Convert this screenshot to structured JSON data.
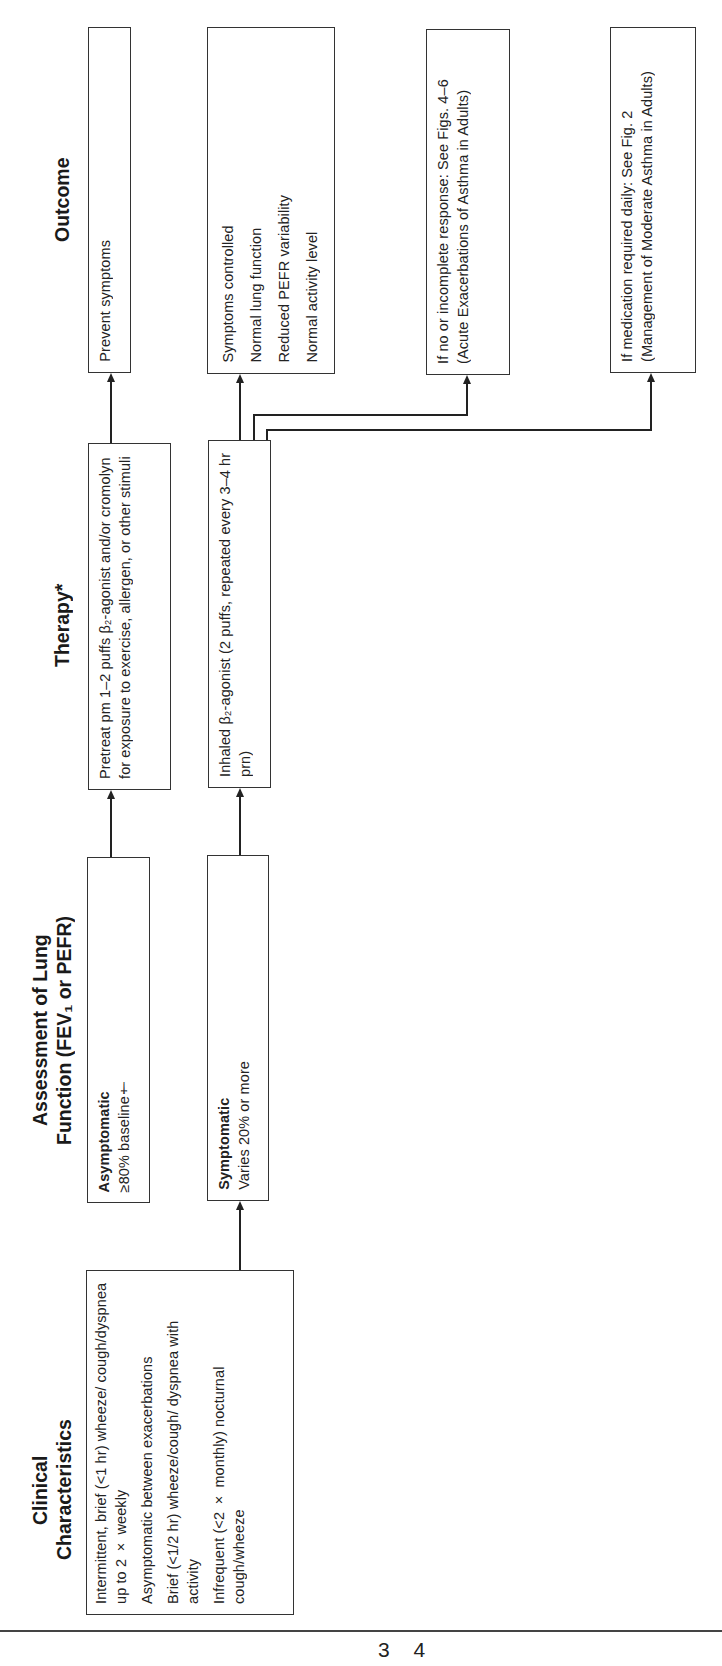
{
  "headers": {
    "clinical": "Clinical Characteristics",
    "clinical_line1": "Clinical",
    "clinical_line2": "Characteristics",
    "assessment_line1": "Assessment of Lung",
    "assessment_line2": "Function (FEV₁ or PEFR)",
    "therapy": "Therapy*",
    "outcome": "Outcome"
  },
  "clinical_box": {
    "items": [
      "Intermittent, brief (<1 hr) wheeze/ cough/dyspnea up to 2 × weekly",
      "Asymptomatic between exacerbations",
      "Brief (<1/2 hr) wheeze/cough/ dyspnea with activity",
      "Infrequent (<2 × monthly) nocturnal cough/wheeze"
    ]
  },
  "assessment_boxes": [
    {
      "title": "Asymptomatic",
      "text": "≥80% baseline†"
    },
    {
      "title": "Symptomatic",
      "text": "Varies 20% or more"
    }
  ],
  "therapy_boxes": [
    {
      "text": "Pretreat pm 1–2 puffs β₂-agonist and/or cromolyn for exposure to exercise, allergen, or other stimuli"
    },
    {
      "text": "Inhaled β₂-agonist (2 puffs, repeated every 3–4 hr prn)"
    }
  ],
  "outcome_boxes": [
    {
      "text": "Prevent symptoms"
    },
    {
      "items": [
        "Symptoms controlled",
        "Normal lung function",
        "Reduced PEFR variability",
        "Normal activity level"
      ]
    },
    {
      "text": "If no or incomplete response: See Figs. 4–6 (Acute Exacerbations of Asthma in Adults)"
    },
    {
      "text": "If medication required daily: See Fig. 2 (Management of Moderate Asthma in Adults)"
    }
  ],
  "page_number": "3 4",
  "colors": {
    "ink": "#222222",
    "background": "#ffffff"
  }
}
